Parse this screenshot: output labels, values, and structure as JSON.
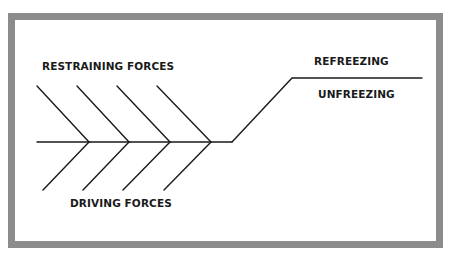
{
  "diagram": {
    "labels": {
      "restraining": "RESTRAINING FORCES",
      "driving": "DRIVING FORCES",
      "refreezing": "REFREEZING",
      "unfreezing": "UNFREEZING"
    },
    "colors": {
      "frame": "#8c8c8c",
      "line": "#1a1a1a",
      "background": "#ffffff"
    },
    "force_count": 4
  }
}
